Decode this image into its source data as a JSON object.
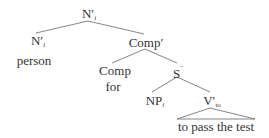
{
  "tree": {
    "root": {
      "label": "N",
      "prime": "′",
      "index": "i"
    },
    "left_child": {
      "label": "N",
      "prime": "′",
      "index": "i",
      "word": "person"
    },
    "comp_bar": {
      "label": "Comp",
      "prime": "′"
    },
    "comp": {
      "label": "Comp",
      "word": "for"
    },
    "s_bar": {
      "label": "S",
      "bar": "‾"
    },
    "np": {
      "label": "NP",
      "index": "i"
    },
    "v_bar": {
      "label": "V",
      "prime": "′",
      "sub": "to",
      "word": "to pass the test"
    }
  },
  "colors": {
    "text": "#333333",
    "lines": "#555555",
    "background": "#ffffff"
  }
}
